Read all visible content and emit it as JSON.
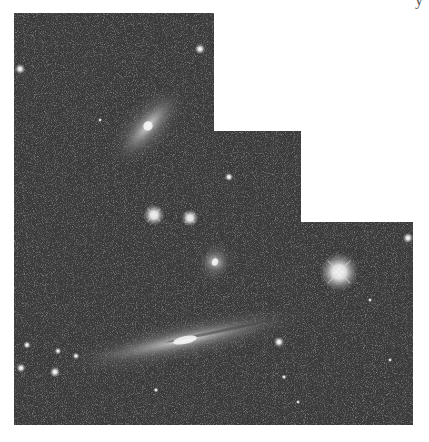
{
  "image": {
    "subject": "astronomical mosaic of galaxies and stars",
    "shape": "stepped L-shaped mosaic footprint",
    "background_color": "#ffffff",
    "sky_color": "#3b3b3b",
    "cropped_caption_fragment": "y",
    "mosaic_polygon": [
      [
        14,
        13
      ],
      [
        214,
        13
      ],
      [
        214,
        131
      ],
      [
        301,
        131
      ],
      [
        301,
        222
      ],
      [
        413,
        222
      ],
      [
        413,
        425
      ],
      [
        14,
        425
      ]
    ],
    "objects": [
      {
        "name": "spiral-galaxy-upper",
        "type": "galaxy",
        "cx": 148,
        "cy": 126,
        "rx": 40,
        "ry": 13,
        "angle": -48
      },
      {
        "name": "edge-on-galaxy",
        "type": "galaxy",
        "cx": 185,
        "cy": 340,
        "rx": 100,
        "ry": 11,
        "angle": -12
      },
      {
        "name": "small-galaxy",
        "type": "galaxy",
        "cx": 215,
        "cy": 262,
        "rx": 14,
        "ry": 11,
        "angle": 20
      },
      {
        "name": "bright-star-right",
        "type": "star",
        "cx": 339,
        "cy": 272,
        "r": 9
      },
      {
        "name": "star-pair-left",
        "type": "star",
        "cx": 154,
        "cy": 215,
        "r": 5
      },
      {
        "name": "star-pair-right",
        "type": "star",
        "cx": 190,
        "cy": 218,
        "r": 4
      },
      {
        "name": "star-top-left",
        "type": "star",
        "cx": 20,
        "cy": 69,
        "r": 2.5
      },
      {
        "name": "star-top-right",
        "type": "star",
        "cx": 200,
        "cy": 49,
        "r": 2.5
      },
      {
        "name": "star-mid",
        "type": "star",
        "cx": 229,
        "cy": 177,
        "r": 2
      },
      {
        "name": "star-far-right",
        "type": "star",
        "cx": 408,
        "cy": 238,
        "r": 2.5
      },
      {
        "name": "star-lower-mid",
        "type": "star",
        "cx": 279,
        "cy": 342,
        "r": 2.5
      },
      {
        "name": "star-cluster-1",
        "type": "star",
        "cx": 27,
        "cy": 345,
        "r": 1.8
      },
      {
        "name": "star-cluster-2",
        "type": "star",
        "cx": 21,
        "cy": 368,
        "r": 2.2
      },
      {
        "name": "star-cluster-3",
        "type": "star",
        "cx": 55,
        "cy": 372,
        "r": 2.5
      },
      {
        "name": "star-cluster-4",
        "type": "star",
        "cx": 58,
        "cy": 351,
        "r": 1.6
      },
      {
        "name": "star-cluster-5",
        "type": "star",
        "cx": 76,
        "cy": 356,
        "r": 1.6
      },
      {
        "name": "star-faint-1",
        "type": "star",
        "cx": 156,
        "cy": 390,
        "r": 1.2
      },
      {
        "name": "star-faint-2",
        "type": "star",
        "cx": 284,
        "cy": 377,
        "r": 1.2
      },
      {
        "name": "star-faint-3",
        "type": "star",
        "cx": 298,
        "cy": 402,
        "r": 1.0
      },
      {
        "name": "star-faint-4",
        "type": "star",
        "cx": 100,
        "cy": 120,
        "r": 1.0
      },
      {
        "name": "star-faint-5",
        "type": "star",
        "cx": 370,
        "cy": 300,
        "r": 1.0
      },
      {
        "name": "star-faint-6",
        "type": "star",
        "cx": 390,
        "cy": 360,
        "r": 1.0
      }
    ]
  }
}
